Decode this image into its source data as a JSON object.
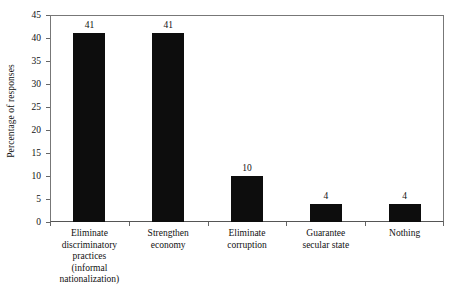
{
  "chart_data": {
    "type": "bar",
    "title": "",
    "xlabel": "",
    "ylabel": "Percentage of responses",
    "ylim": [
      0,
      45
    ],
    "yticks": [
      0,
      5,
      10,
      15,
      20,
      25,
      30,
      35,
      40,
      45
    ],
    "grid": false,
    "legend": false,
    "bar_color": "#0d0d0d",
    "axis_color": "#666666",
    "categories": [
      "Eliminate discriminatory practices (informal nationalization)",
      "Strengthen economy",
      "Eliminate corruption",
      "Guarantee secular state",
      "Nothing"
    ],
    "category_lines": [
      [
        "Eliminate",
        "discriminatory",
        "practices",
        "(informal",
        "nationalization)"
      ],
      [
        "Strengthen",
        "economy"
      ],
      [
        "Eliminate",
        "corruption"
      ],
      [
        "Guarantee",
        "secular state"
      ],
      [
        "Nothing"
      ]
    ],
    "values": [
      41,
      41,
      10,
      4,
      4
    ],
    "value_labels": [
      "41",
      "41",
      "10",
      "4",
      "4"
    ]
  }
}
